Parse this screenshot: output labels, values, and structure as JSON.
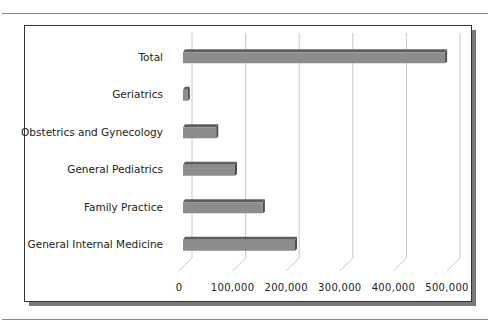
{
  "chart_data": {
    "type": "bar",
    "orientation": "horizontal",
    "style": "3d",
    "title": "",
    "xlabel": "",
    "ylabel": "",
    "categories": [
      "General Internal Medicine",
      "Family Practice",
      "General Pediatrics",
      "Obstetrics and Gynecology",
      "Geriatrics",
      "Total"
    ],
    "values": [
      209000,
      149000,
      97000,
      62000,
      9000,
      489000
    ],
    "xlim": [
      0,
      500000
    ],
    "xticks": [
      0,
      100000,
      200000,
      300000,
      400000,
      500000
    ],
    "xtick_labels": [
      "0",
      "100,000",
      "200,000",
      "300,000",
      "400,000",
      "500,000"
    ],
    "grid": true,
    "legend": "none",
    "bar_color": "#8c8c8c"
  }
}
